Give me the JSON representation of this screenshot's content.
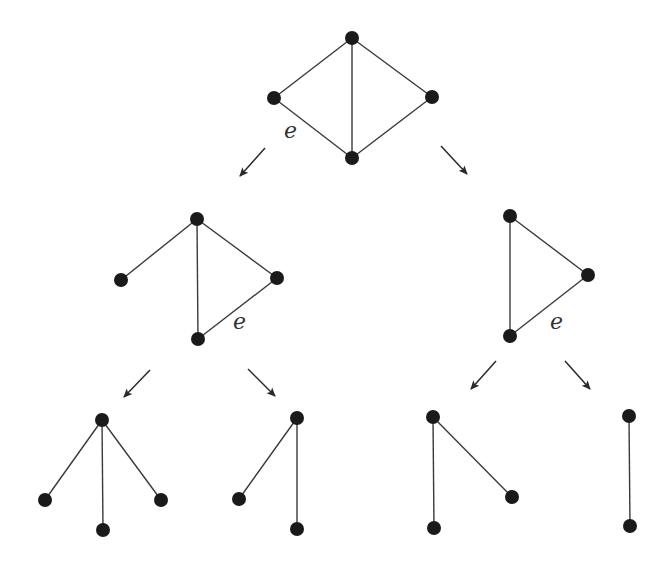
{
  "diagram": {
    "type": "graph-tree",
    "colors": {
      "node": "#1a1a1a",
      "edge": "#3a3a3a",
      "arrow": "#2a2a2a",
      "label": "#333333",
      "background": "#ffffff"
    },
    "node_radius": 7,
    "graphs": [
      {
        "id": "root",
        "nodes": [
          [
            352,
            38
          ],
          [
            274,
            98
          ],
          [
            432,
            97
          ],
          [
            352,
            158
          ]
        ],
        "edges": [
          [
            0,
            1
          ],
          [
            0,
            2
          ],
          [
            0,
            3
          ],
          [
            1,
            3
          ],
          [
            2,
            3
          ]
        ],
        "label": {
          "text": "e",
          "x": 284,
          "y": 138
        }
      },
      {
        "id": "mid-left",
        "nodes": [
          [
            197,
            219
          ],
          [
            121,
            280
          ],
          [
            277,
            278
          ],
          [
            198,
            339
          ]
        ],
        "edges": [
          [
            0,
            1
          ],
          [
            0,
            2
          ],
          [
            0,
            3
          ],
          [
            2,
            3
          ]
        ],
        "label": {
          "text": "e",
          "x": 233,
          "y": 329
        }
      },
      {
        "id": "mid-right",
        "nodes": [
          [
            510,
            216
          ],
          [
            588,
            275
          ],
          [
            510,
            336
          ]
        ],
        "edges": [
          [
            0,
            1
          ],
          [
            0,
            2
          ],
          [
            1,
            2
          ]
        ],
        "label": {
          "text": "e",
          "x": 550,
          "y": 329
        }
      },
      {
        "id": "bottom-1",
        "nodes": [
          [
            102,
            420
          ],
          [
            45,
            500
          ],
          [
            103,
            530
          ],
          [
            161,
            500
          ]
        ],
        "edges": [
          [
            0,
            1
          ],
          [
            0,
            2
          ],
          [
            0,
            3
          ]
        ],
        "label": null
      },
      {
        "id": "bottom-2",
        "nodes": [
          [
            297,
            418
          ],
          [
            239,
            499
          ],
          [
            297,
            529
          ]
        ],
        "edges": [
          [
            0,
            1
          ],
          [
            0,
            2
          ]
        ],
        "label": null
      },
      {
        "id": "bottom-3",
        "nodes": [
          [
            433,
            417
          ],
          [
            512,
            497
          ],
          [
            434,
            528
          ]
        ],
        "edges": [
          [
            0,
            1
          ],
          [
            0,
            2
          ]
        ],
        "label": null
      },
      {
        "id": "bottom-4",
        "nodes": [
          [
            629,
            416
          ],
          [
            630,
            526
          ]
        ],
        "edges": [
          [
            0,
            1
          ]
        ],
        "label": null
      }
    ],
    "arrows": [
      {
        "from": [
          265,
          148
        ],
        "to": [
          240,
          176
        ]
      },
      {
        "from": [
          441,
          146
        ],
        "to": [
          467,
          174
        ]
      },
      {
        "from": [
          150,
          370
        ],
        "to": [
          124,
          397
        ]
      },
      {
        "from": [
          248,
          369
        ],
        "to": [
          275,
          396
        ]
      },
      {
        "from": [
          496,
          361
        ],
        "to": [
          471,
          389
        ]
      },
      {
        "from": [
          565,
          361
        ],
        "to": [
          590,
          389
        ]
      }
    ]
  }
}
